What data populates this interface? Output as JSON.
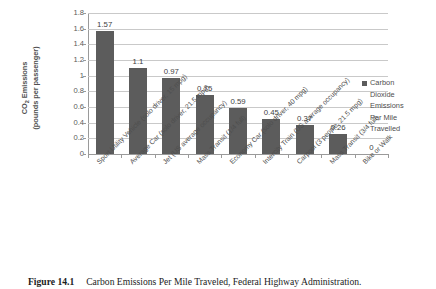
{
  "chart_data": {
    "type": "bar",
    "title": "",
    "xlabel": "",
    "ylabel": "CO2 Emissions (pounds per passenger)",
    "ylabel_line1": "CO",
    "ylabel_sub": "2",
    "ylabel_line1_rest": " Emissions",
    "ylabel_line2": "(pounds per passenger)",
    "ylim": [
      0,
      1.8
    ],
    "ytick_labels": [
      "1.8",
      "1.6",
      "1.4",
      "1.2",
      "1",
      "0.8",
      "0.6",
      "0.4",
      "0.2",
      "0"
    ],
    "ytick_values": [
      1.8,
      1.6,
      1.4,
      1.2,
      1,
      0.8,
      0.6,
      0.4,
      0.2,
      0
    ],
    "grid": true,
    "legend_position": "right",
    "bar_color": "#5c5c5c",
    "gridline_color": "#c9c9c9",
    "axis_color": "#9a9a9a",
    "categories": [
      "Sport Utility Vehicle (solo driver, 15 mpg)",
      "Average Car (solo driver, 21.5 mpg)",
      "Jet (US average occupancy)",
      "Mass Transit (1/4 full)",
      "Economy Car (solo driver, 40 mpg)",
      "Intercity Train (US average occupancy)",
      "Carpool (3 people, 21.5 mpg)",
      "Mass Transit (3/4 full)",
      "Bike or Walk"
    ],
    "values": [
      1.57,
      1.1,
      0.97,
      0.75,
      0.59,
      0.45,
      0.37,
      0.26,
      0
    ],
    "value_labels": [
      "1.57",
      "1.1",
      "0.97",
      "0.75",
      "0.59",
      "0.45",
      "0.37",
      "0.26",
      "0"
    ],
    "series": [
      {
        "name": "Carbon Dioxide Emissions Per Mile Travelled",
        "values": [
          1.57,
          1.1,
          0.97,
          0.75,
          0.59,
          0.45,
          0.37,
          0.26,
          0
        ]
      }
    ],
    "legend": {
      "entries": [
        "Carbon Dioxide Emissions Per Mile Travelled"
      ],
      "wrapped_lines": [
        "Carbon",
        "Dioxide",
        "Emissions",
        "Per Mile",
        "Travelled"
      ]
    }
  },
  "caption": {
    "label": "Figure 14.1",
    "text": "Carbon Emissions Per Mile Traveled, Federal Highway Administration."
  }
}
